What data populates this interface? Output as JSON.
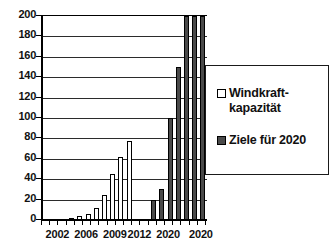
{
  "chart_data": {
    "type": "bar",
    "title": "",
    "subtitle": "",
    "xlabel": "",
    "ylabel": "",
    "ylim": [
      0,
      200
    ],
    "ytick_values": [
      0,
      20,
      40,
      60,
      80,
      100,
      120,
      140,
      160,
      180,
      200
    ],
    "ytick_labels": [
      "0",
      "20",
      "40",
      "60",
      "80",
      "100",
      "120",
      "140",
      "160",
      "180",
      "200"
    ],
    "grid": true,
    "grid_axis": "y",
    "legend_position": "right-inside",
    "xtick_labels": [
      "2002",
      "2006",
      "2009",
      "2012",
      "2020",
      "2020"
    ],
    "xtick_positions": [
      1.5,
      5.0,
      8.5,
      11.5,
      15.0,
      19.0
    ],
    "categories": [
      "2002",
      "2003",
      "2004",
      "2005",
      "2006",
      "2007",
      "2008",
      "2009",
      "2010",
      "2011",
      "2012",
      "2013",
      "2014",
      "2015",
      "2016",
      "2017",
      "2018",
      "2019",
      "2020",
      "2021"
    ],
    "series": [
      {
        "name": "Windkraft-\nkapazität",
        "color": "#ffffff",
        "edge_color": "#000000",
        "values": [
          0,
          0,
          1,
          2,
          4,
          6,
          12,
          25,
          45,
          62,
          77,
          0,
          0,
          0,
          0,
          0,
          0,
          0,
          0,
          0
        ]
      },
      {
        "name": "Ziele für 2020",
        "color": "#4a4a4a",
        "edge_color": "#000000",
        "values": [
          0,
          0,
          0,
          0,
          0,
          0,
          0,
          0,
          0,
          0,
          0,
          0,
          0,
          20,
          30,
          100,
          150,
          200,
          200,
          200
        ]
      }
    ]
  },
  "legend": {
    "entries": [
      {
        "label": "Windkraft-\nkapazität",
        "swatch": "light-square"
      },
      {
        "label": "Ziele für 2020",
        "swatch": "dark-square"
      }
    ]
  }
}
